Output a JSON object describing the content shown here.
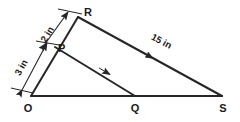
{
  "figure": {
    "kind": "geometry-diagram",
    "background_color": "#ffffff",
    "stroke_color": "#262626",
    "text_color": "#1a1a1a"
  },
  "vertices": {
    "O": {
      "label": "O",
      "x": 31,
      "y": 96
    },
    "R": {
      "label": "R",
      "x": 78,
      "y": 17
    },
    "S": {
      "label": "S",
      "x": 222,
      "y": 96
    },
    "P": {
      "label": "P",
      "x": 55,
      "y": 47
    },
    "Q": {
      "label": "Q",
      "x": 135,
      "y": 96
    }
  },
  "segments": [
    {
      "name": "O-R",
      "from": "O",
      "to": "R",
      "arrow": "none"
    },
    {
      "name": "O-S",
      "from": "O",
      "to": "S",
      "arrow": "none"
    },
    {
      "name": "R-S",
      "from": "R",
      "to": "S",
      "arrow": "midpoint"
    },
    {
      "name": "P-Q",
      "from": "P",
      "to": "Q",
      "arrow": "midpoint"
    }
  ],
  "dimensions": [
    {
      "name": "segment-PR-length",
      "label": "2 in",
      "measures": "P to R",
      "value": 2,
      "unit": "in",
      "rotated": true
    },
    {
      "name": "segment-OP-length",
      "label": "3 in",
      "measures": "O to P",
      "value": 3,
      "unit": "in",
      "rotated": true
    },
    {
      "name": "segment-RS-length",
      "label": "15 in",
      "measures": "R to S",
      "value": 15,
      "unit": "in",
      "rotated": true
    }
  ]
}
